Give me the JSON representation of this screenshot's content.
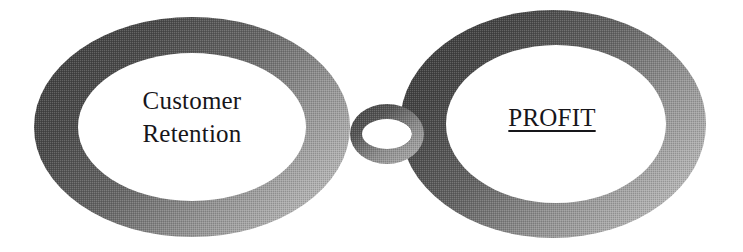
{
  "diagram": {
    "type": "two-interlocking-rings-chain",
    "background_color": "#ffffff",
    "nodes": [
      {
        "id": "customer-retention",
        "label_line1": "Customer",
        "label_line2": "Retention",
        "shape": "ellipse-ring",
        "underline": false,
        "ring_color_dark": "#4b4b4b",
        "ring_color_light": "#b6b6b6",
        "fill_color": "#ffffff"
      },
      {
        "id": "profit",
        "label_line1": "PROFIT",
        "label_line2": "",
        "shape": "ellipse-ring",
        "underline": true,
        "ring_color_dark": "#454545",
        "ring_color_light": "#b9b9b9",
        "fill_color": "#ffffff"
      }
    ],
    "connector": {
      "id": "link-ring",
      "shape": "small-ellipse-ring",
      "ring_color_dark": "#4f4f4f",
      "ring_color_light": "#aeaeae",
      "fill_color": "#ffffff"
    },
    "text_color": "#17161a"
  }
}
